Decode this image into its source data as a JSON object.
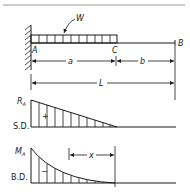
{
  "figure": {
    "beam": {
      "support_label": "A",
      "load_end_label": "C",
      "free_end_label": "B",
      "load_label": "W",
      "dimensions": {
        "loaded_length": "a",
        "unloaded_length": "b",
        "total_length": "L"
      }
    },
    "shear_diagram": {
      "label": "S.D.",
      "max_label": "R",
      "max_label_sub": "A",
      "sign": "+"
    },
    "moment_diagram": {
      "label": "B.D.",
      "max_label": "M",
      "max_label_sub": "A",
      "sign": "−",
      "dimension_label": "x"
    }
  },
  "colors": {
    "ink": "#1a1a1a",
    "rule": "#9a9a9a",
    "background": "#ffffff"
  }
}
